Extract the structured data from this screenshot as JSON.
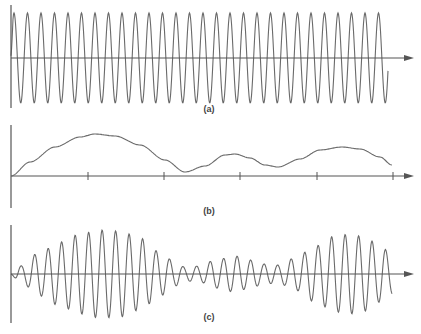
{
  "colors": {
    "axis": "#555555",
    "wave": "#6a6a6a",
    "label": "#444444",
    "background": "#ffffff"
  },
  "panels": [
    {
      "id": "a",
      "label": "(a)",
      "description": "carrier signal",
      "axis_y": 58,
      "vaxis": [
        5,
        108
      ],
      "label_y": 104,
      "carrier": {
        "period_px": 13.5,
        "start_x": 11,
        "end_x": 388,
        "amplitude": 45
      }
    },
    {
      "id": "b",
      "label": "(b)",
      "description": "modulating signal",
      "axis_y": 176,
      "vaxis": [
        125,
        208
      ],
      "label_y": 206,
      "ticks_x": [
        88,
        164,
        240,
        317,
        393
      ],
      "curve_points": [
        [
          11,
          176
        ],
        [
          30,
          162
        ],
        [
          55,
          147
        ],
        [
          80,
          137
        ],
        [
          95,
          134
        ],
        [
          115,
          136
        ],
        [
          140,
          145
        ],
        [
          165,
          160
        ],
        [
          185,
          172
        ],
        [
          205,
          166
        ],
        [
          225,
          155
        ],
        [
          235,
          154
        ],
        [
          250,
          158
        ],
        [
          265,
          165
        ],
        [
          278,
          167
        ],
        [
          300,
          159
        ],
        [
          320,
          150
        ],
        [
          342,
          147
        ],
        [
          360,
          149
        ],
        [
          380,
          157
        ],
        [
          392,
          165
        ]
      ]
    },
    {
      "id": "c",
      "label": "(c)",
      "description": "amplitude-modulated signal",
      "axis_y": 274,
      "vaxis": [
        225,
        323
      ],
      "label_y": 312,
      "carrier": {
        "period_px": 13.5,
        "start_x": 11,
        "end_x": 392
      },
      "envelope_points": [
        [
          11,
          1
        ],
        [
          20,
          8
        ],
        [
          40,
          22
        ],
        [
          60,
          32
        ],
        [
          80,
          40
        ],
        [
          100,
          44
        ],
        [
          120,
          43
        ],
        [
          140,
          36
        ],
        [
          160,
          22
        ],
        [
          175,
          12
        ],
        [
          185,
          7
        ],
        [
          200,
          8
        ],
        [
          215,
          14
        ],
        [
          235,
          18
        ],
        [
          250,
          14
        ],
        [
          265,
          10
        ],
        [
          278,
          9
        ],
        [
          295,
          16
        ],
        [
          315,
          28
        ],
        [
          335,
          38
        ],
        [
          350,
          40
        ],
        [
          365,
          37
        ],
        [
          380,
          28
        ],
        [
          392,
          20
        ]
      ]
    }
  ],
  "axis_end_x": 414
}
